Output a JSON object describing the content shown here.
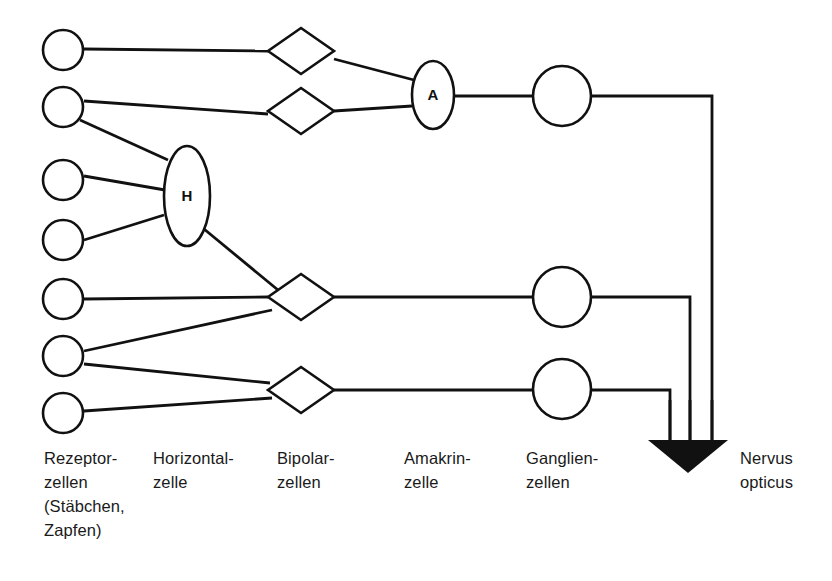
{
  "diagram": {
    "language": "de",
    "background_color": "#ffffff",
    "stroke_color": "#111111",
    "nerve_fill_color": "#111111"
  },
  "inner_labels": {
    "horizontal_cell": "H",
    "amakrine_cell": "A"
  },
  "column_labels": [
    {
      "id": "rezeptorzellen",
      "text": "Rezeptor-\nzellen\n(Stäbchen,\nZapfen)",
      "x": 44,
      "y": 446
    },
    {
      "id": "horizontalzelle",
      "text": "Horizontal-\nzelle",
      "x": 153,
      "y": 446
    },
    {
      "id": "bipolarzellen",
      "text": "Bipolar-\nzellen",
      "x": 277,
      "y": 446
    },
    {
      "id": "amakrinzelle",
      "text": "Amakrin-\nzelle",
      "x": 404,
      "y": 446
    },
    {
      "id": "ganglienzellen",
      "text": "Ganglien-\nzellen",
      "x": 526,
      "y": 446
    },
    {
      "id": "nervus-opticus",
      "text": "Nervus\nopticus",
      "x": 740,
      "y": 446
    }
  ],
  "nodes": {
    "receptor_cells": [
      {
        "id": "receptor-1",
        "cx": 63,
        "cy": 50,
        "rx": 20,
        "ry": 20
      },
      {
        "id": "receptor-2",
        "cx": 63,
        "cy": 107,
        "rx": 20,
        "ry": 20
      },
      {
        "id": "receptor-3",
        "cx": 63,
        "cy": 180,
        "rx": 20,
        "ry": 20
      },
      {
        "id": "receptor-4",
        "cx": 63,
        "cy": 240,
        "rx": 20,
        "ry": 20
      },
      {
        "id": "receptor-5",
        "cx": 63,
        "cy": 299,
        "rx": 20,
        "ry": 20
      },
      {
        "id": "receptor-6",
        "cx": 63,
        "cy": 356,
        "rx": 20,
        "ry": 20
      },
      {
        "id": "receptor-7",
        "cx": 63,
        "cy": 413,
        "rx": 20,
        "ry": 20
      }
    ],
    "horizontal_cell": {
      "id": "horizontal-cell",
      "cx": 187,
      "cy": 196,
      "rx": 23,
      "ry": 50
    },
    "bipolar_cells": [
      {
        "id": "bipolar-1",
        "cx": 301,
        "cy": 51,
        "hw": 33,
        "hh": 23
      },
      {
        "id": "bipolar-2",
        "cx": 301,
        "cy": 111,
        "hw": 33,
        "hh": 23
      },
      {
        "id": "bipolar-3",
        "cx": 301,
        "cy": 297,
        "hw": 33,
        "hh": 23
      },
      {
        "id": "bipolar-4",
        "cx": 301,
        "cy": 390,
        "hw": 33,
        "hh": 23
      }
    ],
    "amakrine_cell": {
      "id": "amakrine-cell",
      "cx": 433,
      "cy": 95,
      "rx": 21,
      "ry": 34
    },
    "ganglion_cells": [
      {
        "id": "ganglion-1",
        "cx": 562,
        "cy": 96,
        "rx": 29,
        "ry": 30
      },
      {
        "id": "ganglion-2",
        "cx": 562,
        "cy": 297,
        "rx": 29,
        "ry": 30
      },
      {
        "id": "ganglion-3",
        "cx": 562,
        "cy": 389,
        "rx": 29,
        "ry": 30
      }
    ],
    "optic_nerve": {
      "id": "optic-nerve-triangle",
      "points": "648,440 728,440 688,473",
      "trunk_lines": [
        {
          "id": "trunk-left",
          "x": 670,
          "y_top": 400,
          "y_bottom": 440
        },
        {
          "id": "trunk-middle",
          "x": 690,
          "y_top": 400,
          "y_bottom": 440
        },
        {
          "id": "trunk-right",
          "x": 712,
          "y_top": 400,
          "y_bottom": 440
        }
      ]
    }
  },
  "connections": [
    {
      "id": "r1-b1",
      "from": "receptor-1",
      "to": "bipolar-1",
      "d": "M 84,49 L 268,51"
    },
    {
      "id": "r2-b2",
      "from": "receptor-2",
      "to": "bipolar-2",
      "d": "M 84,101 L 268,114"
    },
    {
      "id": "r2-h",
      "from": "receptor-2",
      "to": "horizontal-cell",
      "d": "M 80,120 L 168,160"
    },
    {
      "id": "r3-h",
      "from": "receptor-3",
      "to": "horizontal-cell",
      "d": "M 84,176 L 165,190"
    },
    {
      "id": "r4-h",
      "from": "receptor-4",
      "to": "horizontal-cell",
      "d": "M 84,240 L 164,215"
    },
    {
      "id": "h-b3",
      "from": "horizontal-cell",
      "to": "bipolar-3",
      "d": "M 204,229 L 278,290"
    },
    {
      "id": "r5-b3",
      "from": "receptor-5",
      "to": "bipolar-3",
      "d": "M 84,299 L 268,297"
    },
    {
      "id": "r6-b3",
      "from": "receptor-6",
      "to": "bipolar-3",
      "d": "M 84,351 L 272,310"
    },
    {
      "id": "r6-b4",
      "from": "receptor-6",
      "to": "bipolar-4",
      "d": "M 84,364 L 270,383"
    },
    {
      "id": "r7-b4",
      "from": "receptor-7",
      "to": "bipolar-4",
      "d": "M 84,411 L 272,398"
    },
    {
      "id": "b1-a",
      "from": "bipolar-1",
      "to": "amakrine-cell",
      "d": "M 334,59 L 414,80"
    },
    {
      "id": "b2-a",
      "from": "bipolar-2",
      "to": "amakrine-cell",
      "d": "M 334,111 L 412,106"
    },
    {
      "id": "a-g1",
      "from": "amakrine-cell",
      "to": "ganglion-1",
      "d": "M 455,96 L 533,96"
    },
    {
      "id": "b3-g2",
      "from": "bipolar-3",
      "to": "ganglion-2",
      "d": "M 334,297 L 533,297"
    },
    {
      "id": "b4-g3",
      "from": "bipolar-4",
      "to": "ganglion-3",
      "d": "M 334,390 L 533,390"
    },
    {
      "id": "g1-nerve",
      "from": "ganglion-1",
      "to": "optic-nerve-triangle",
      "d": "M 591,96 L 712,96 L 712,440"
    },
    {
      "id": "g2-nerve",
      "from": "ganglion-2",
      "to": "optic-nerve-triangle",
      "d": "M 591,297 L 690,297 L 690,440"
    },
    {
      "id": "g3-nerve",
      "from": "ganglion-3",
      "to": "optic-nerve-triangle",
      "d": "M 591,390 L 670,390 L 670,440"
    }
  ]
}
